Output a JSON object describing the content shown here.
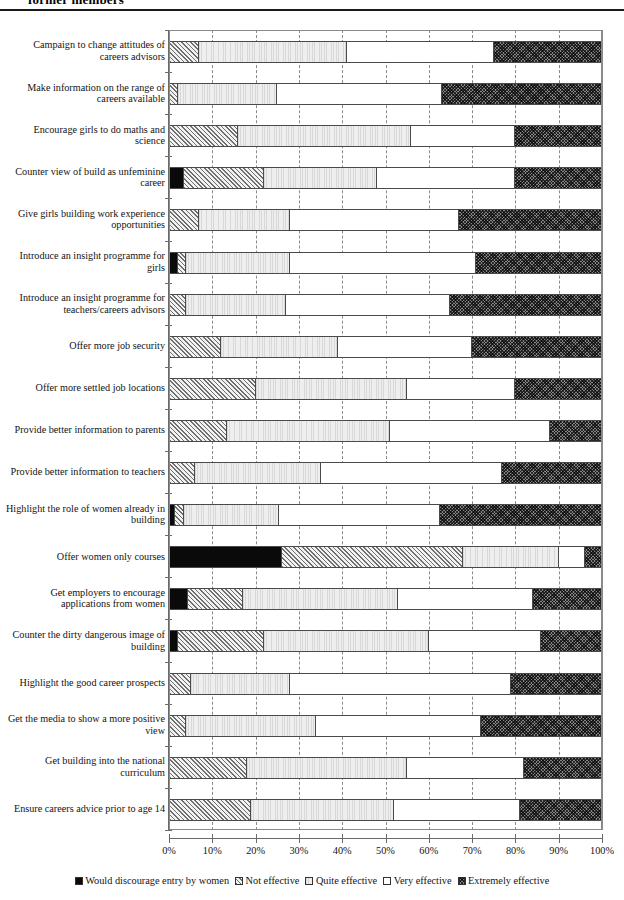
{
  "header": {
    "title": "former members"
  },
  "legend": {
    "position": "bottom",
    "items": [
      {
        "label": "Would discourage entry by women",
        "key": "discourage",
        "swatch": "solid-black-swatch"
      },
      {
        "label": "Not effective",
        "key": "not",
        "swatch": "diagonal-hatch-swatch"
      },
      {
        "label": "Quite effective",
        "key": "quite",
        "swatch": "light-gray-swatch"
      },
      {
        "label": "Very effective",
        "key": "very",
        "swatch": "white-swatch"
      },
      {
        "label": "Extremely effective",
        "key": "extremely",
        "swatch": "crosshatch-swatch"
      }
    ]
  },
  "axis": {
    "ticks": [
      "0%",
      "10%",
      "20%",
      "30%",
      "40%",
      "50%",
      "60%",
      "70%",
      "80%",
      "90%",
      "100%"
    ]
  },
  "chart_data": {
    "type": "bar",
    "orientation": "horizontal",
    "stacked": true,
    "stack_mode": "percent",
    "title": "former members",
    "xlabel": "",
    "ylabel": "",
    "xlim": [
      0,
      100
    ],
    "xticks": [
      0,
      10,
      20,
      30,
      40,
      50,
      60,
      70,
      80,
      90,
      100
    ],
    "grid": "vertical-dashed",
    "legend_position": "bottom",
    "categories": [
      "Campaign to change attitudes of careers advisors",
      "Make information on the range of careers available",
      "Encourage girls to do maths and science",
      "Counter view of build as unfeminine career",
      "Give girls building work experience opportunities",
      "Introduce an insight programme for girls",
      "Introduce an insight programme for teachers/careers advisors",
      "Offer more job security",
      "Offer more settled job locations",
      "Provide better information to parents",
      "Provide better information to teachers",
      "Highlight the role of women already in building",
      "Offer women only courses",
      "Get employers to encourage applications from women",
      "Counter the dirty dangerous image of building",
      "Highlight the good career prospects",
      "Get the media to show a more positive view",
      "Get building into the national curriculum",
      "Ensure careers advice prior to age 14"
    ],
    "series": [
      {
        "name": "Would discourage entry by women",
        "values": [
          0,
          0,
          0,
          3.5,
          0,
          2,
          0,
          0,
          0,
          0,
          0,
          1.5,
          26,
          4.5,
          2,
          0,
          0,
          0,
          0
        ]
      },
      {
        "name": "Not effective",
        "values": [
          7,
          2,
          16,
          18.5,
          7,
          2,
          4,
          12,
          20,
          13.5,
          6,
          2,
          42,
          12.5,
          20,
          5,
          4,
          18,
          19
        ]
      },
      {
        "name": "Quite effective",
        "values": [
          34,
          23,
          40,
          26,
          21,
          24,
          23,
          27,
          35,
          37.5,
          29,
          22,
          22,
          36,
          38,
          23,
          30,
          37,
          33
        ]
      },
      {
        "name": "Very effective",
        "values": [
          34,
          38,
          24,
          32,
          39,
          43,
          38,
          31,
          25,
          37,
          42,
          37,
          6,
          31,
          26,
          51,
          38,
          27,
          29
        ]
      },
      {
        "name": "Extremely effective",
        "values": [
          25,
          37,
          20,
          20,
          33,
          29,
          35,
          30,
          20,
          12,
          23,
          37.5,
          4,
          16,
          14,
          21,
          28,
          18,
          19
        ]
      }
    ],
    "rows": [
      {
        "category": "Campaign to change attitudes of careers advisors",
        "label_lines": [
          "Campaign to change attitudes of",
          "careers advisors"
        ],
        "stack": [
          0,
          7,
          34,
          34,
          25
        ]
      },
      {
        "category": "Make information on the range of careers available",
        "label_lines": [
          "Make information on the range of",
          "careers available"
        ],
        "stack": [
          0,
          2,
          23,
          38,
          37
        ]
      },
      {
        "category": "Encourage girls to do maths and science",
        "label_lines": [
          "Encourage girls to do maths and",
          "science"
        ],
        "stack": [
          0,
          16,
          40,
          24,
          20
        ]
      },
      {
        "category": "Counter view of build as unfeminine career",
        "label_lines": [
          "Counter view of build as unfeminine",
          "career"
        ],
        "stack": [
          3.5,
          18.5,
          26,
          32,
          20
        ]
      },
      {
        "category": "Give girls building work experience opportunities",
        "label_lines": [
          "Give girls building work experience",
          "opportunities"
        ],
        "stack": [
          0,
          7,
          21,
          39,
          33
        ]
      },
      {
        "category": "Introduce an insight programme for girls",
        "label_lines": [
          "Introduce an insight programme for",
          "girls"
        ],
        "stack": [
          2,
          2,
          24,
          43,
          29
        ]
      },
      {
        "category": "Introduce an insight programme for teachers/careers advisors",
        "label_lines": [
          "Introduce an insight programme for",
          "teachers/careers advisors"
        ],
        "stack": [
          0,
          4,
          23,
          38,
          35
        ]
      },
      {
        "category": "Offer more job security",
        "label_lines": [
          "Offer more job security"
        ],
        "stack": [
          0,
          12,
          27,
          31,
          30
        ]
      },
      {
        "category": "Offer more settled job locations",
        "label_lines": [
          "Offer more settled job locations"
        ],
        "stack": [
          0,
          20,
          35,
          25,
          20
        ]
      },
      {
        "category": "Provide better information to parents",
        "label_lines": [
          "Provide better information to parents"
        ],
        "stack": [
          0,
          13.5,
          37.5,
          37,
          12
        ]
      },
      {
        "category": "Provide better information to teachers",
        "label_lines": [
          "Provide better information to teachers"
        ],
        "stack": [
          0,
          6,
          29,
          42,
          23
        ]
      },
      {
        "category": "Highlight the role of women already in building",
        "label_lines": [
          "Highlight the role of women already in",
          "building"
        ],
        "stack": [
          1.5,
          2,
          22,
          37,
          37.5
        ]
      },
      {
        "category": "Offer women only courses",
        "label_lines": [
          "Offer women only courses"
        ],
        "stack": [
          26,
          42,
          22,
          6,
          4
        ]
      },
      {
        "category": "Get employers to encourage applications from women",
        "label_lines": [
          "Get employers to encourage",
          "applications from women"
        ],
        "stack": [
          4.5,
          12.5,
          36,
          31,
          16
        ]
      },
      {
        "category": "Counter the dirty dangerous image of building",
        "label_lines": [
          "Counter the dirty dangerous image of",
          "building"
        ],
        "stack": [
          2,
          20,
          38,
          26,
          14
        ]
      },
      {
        "category": "Highlight the good career prospects",
        "label_lines": [
          "Highlight the good career prospects"
        ],
        "stack": [
          0,
          5,
          23,
          51,
          21
        ]
      },
      {
        "category": "Get the media to show a more positive view",
        "label_lines": [
          "Get the media to show a more positive",
          "view"
        ],
        "stack": [
          0,
          4,
          30,
          38,
          28
        ]
      },
      {
        "category": "Get building into the national curriculum",
        "label_lines": [
          "Get building into the national",
          "curriculum"
        ],
        "stack": [
          0,
          18,
          37,
          27,
          18
        ]
      },
      {
        "category": "Ensure careers advice prior to age 14",
        "label_lines": [
          "Ensure careers advice prior to age 14"
        ],
        "stack": [
          0,
          19,
          33,
          29,
          19
        ]
      }
    ]
  }
}
